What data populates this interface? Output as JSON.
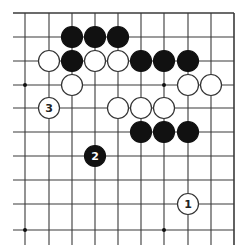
{
  "diagram": {
    "type": "go-board-diagram",
    "board": {
      "background": "#ffffff",
      "line_color": "#3a3a3a",
      "cols_x": [
        25,
        49,
        72,
        95,
        118,
        141,
        164,
        188,
        211,
        234
      ],
      "rows_y": [
        13,
        37,
        61,
        85,
        108,
        132,
        156,
        180,
        204,
        230
      ],
      "edges": {
        "top": true,
        "right": true,
        "left": false,
        "bottom": false
      },
      "star_points": [
        [
          0,
          3
        ],
        [
          6,
          3
        ],
        [
          0,
          9
        ],
        [
          6,
          9
        ]
      ]
    },
    "stone_colors": {
      "black": "#111111",
      "white": "#ffffff",
      "outline": "#333333"
    },
    "stones": [
      {
        "color": "black",
        "col": 2,
        "row": 1,
        "label": ""
      },
      {
        "color": "black",
        "col": 3,
        "row": 1,
        "label": ""
      },
      {
        "color": "black",
        "col": 4,
        "row": 1,
        "label": ""
      },
      {
        "color": "white",
        "col": 1,
        "row": 2,
        "label": ""
      },
      {
        "color": "black",
        "col": 2,
        "row": 2,
        "label": ""
      },
      {
        "color": "white",
        "col": 3,
        "row": 2,
        "label": ""
      },
      {
        "color": "white",
        "col": 4,
        "row": 2,
        "label": ""
      },
      {
        "color": "black",
        "col": 5,
        "row": 2,
        "label": ""
      },
      {
        "color": "black",
        "col": 6,
        "row": 2,
        "label": ""
      },
      {
        "color": "black",
        "col": 7,
        "row": 2,
        "label": ""
      },
      {
        "color": "white",
        "col": 2,
        "row": 3,
        "label": ""
      },
      {
        "color": "white",
        "col": 7,
        "row": 3,
        "label": ""
      },
      {
        "color": "white",
        "col": 8,
        "row": 3,
        "label": ""
      },
      {
        "color": "white",
        "col": 1,
        "row": 4,
        "label": "3"
      },
      {
        "color": "white",
        "col": 4,
        "row": 4,
        "label": ""
      },
      {
        "color": "white",
        "col": 5,
        "row": 4,
        "label": ""
      },
      {
        "color": "white",
        "col": 6,
        "row": 4,
        "label": ""
      },
      {
        "color": "black",
        "col": 5,
        "row": 5,
        "label": ""
      },
      {
        "color": "black",
        "col": 6,
        "row": 5,
        "label": ""
      },
      {
        "color": "black",
        "col": 7,
        "row": 5,
        "label": ""
      },
      {
        "color": "black",
        "col": 3,
        "row": 6,
        "label": "2"
      },
      {
        "color": "white",
        "col": 7,
        "row": 8,
        "label": "1"
      }
    ],
    "move_labels": [
      "1",
      "2",
      "3"
    ]
  }
}
